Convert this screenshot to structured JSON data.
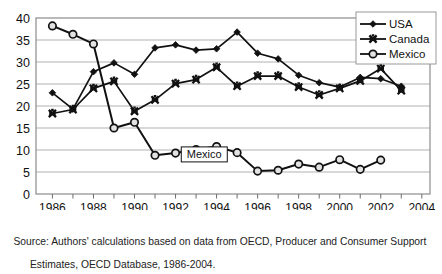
{
  "chart_data": {
    "type": "line",
    "title": "",
    "xlabel": "",
    "ylabel": "",
    "xlim": [
      1985.2,
      2004.4
    ],
    "ylim": [
      0,
      40
    ],
    "ytick_step": 5,
    "yticks": [
      "0",
      "5",
      "10",
      "15",
      "20",
      "25",
      "30",
      "35",
      "40"
    ],
    "xticks": [
      "1986",
      "1988",
      "1990",
      "1992",
      "1994",
      "1996",
      "1998",
      "2000",
      "2002",
      "2004"
    ],
    "grid": "horizontal",
    "legend_position": "top-right",
    "x": [
      1986,
      1987,
      1988,
      1989,
      1990,
      1991,
      1992,
      1993,
      1994,
      1995,
      1996,
      1997,
      1998,
      1999,
      2000,
      2001,
      2002,
      2003
    ],
    "series": [
      {
        "name": "USA",
        "marker": "diamond",
        "values": [
          23.0,
          19.3,
          27.8,
          29.8,
          27.2,
          33.2,
          33.9,
          32.7,
          33.0,
          36.8,
          32.0,
          30.7,
          27.0,
          25.3,
          24.3,
          26.5,
          26.2,
          24.5
        ]
      },
      {
        "name": "Canada",
        "marker": "cross",
        "values": [
          18.3,
          19.2,
          24.0,
          25.6,
          18.8,
          21.4,
          25.1,
          26.0,
          28.8,
          24.5,
          26.8,
          26.8,
          24.3,
          22.5,
          24.0,
          25.7,
          28.5,
          23.5
        ]
      },
      {
        "name": "Mexico",
        "marker": "circle",
        "values": [
          38.2,
          36.3,
          34.1,
          15.0,
          16.3,
          8.8,
          9.3,
          10.1,
          10.8,
          9.4,
          5.2,
          5.4,
          6.8,
          6.1,
          7.8,
          5.6,
          7.7,
          null
        ]
      }
    ],
    "annotations": [
      {
        "text": "Mexico",
        "x": 1993.4,
        "y": 9.0
      }
    ]
  },
  "legend": {
    "items": [
      {
        "label": "USA"
      },
      {
        "label": "Canada"
      },
      {
        "label": "Mexico"
      }
    ]
  },
  "source": {
    "line1": "Source: Authors' calculations based on data from OECD, Producer and Consumer Support",
    "line2": "Estimates, OECD Database, 1986-2004."
  }
}
